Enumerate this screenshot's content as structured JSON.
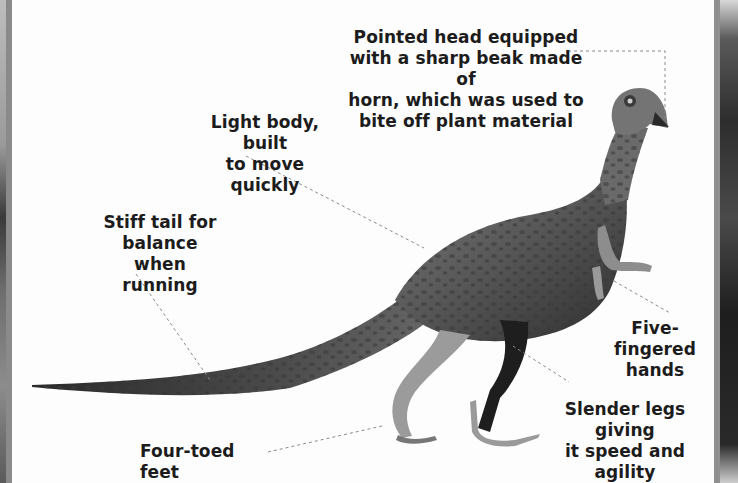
{
  "figure": {
    "labels": [
      {
        "id": "head",
        "text": "Pointed head equipped\nwith a sharp beak made of\nhorn, which was used to\nbite off plant material"
      },
      {
        "id": "body",
        "text": "Light body, built\nto move quickly"
      },
      {
        "id": "tail",
        "text": "Stiff tail for\nbalance when\nrunning"
      },
      {
        "id": "hands",
        "text": "Five-fingered\nhands"
      },
      {
        "id": "legs",
        "text": "Slender legs giving\nit speed and agility"
      },
      {
        "id": "feet",
        "text": "Four-toed feet"
      }
    ]
  },
  "colors": {
    "background": "#fdfdfd",
    "text": "#1c1c1c",
    "leader_line": "#8a8a8a",
    "body_dark": "#2b2b2b",
    "body_mid": "#6b6b6b",
    "skin_light": "#a8a8a8"
  }
}
